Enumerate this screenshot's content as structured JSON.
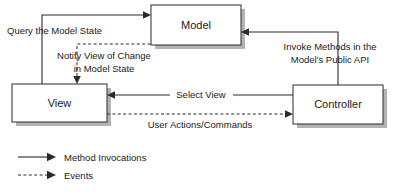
{
  "diagram": {
    "background_color": "#ffffff",
    "line_color": "#2b2b2b",
    "shadow_color": "#b3b3b3",
    "nodes": [
      {
        "id": "model",
        "label": "Model",
        "x": 151,
        "y": 5,
        "w": 90,
        "h": 40
      },
      {
        "id": "view",
        "label": "View",
        "x": 12,
        "y": 84,
        "w": 95,
        "h": 38
      },
      {
        "id": "controller",
        "label": "Controller",
        "x": 293,
        "y": 85,
        "w": 90,
        "h": 39
      }
    ],
    "edges": [
      {
        "id": "query-model-state",
        "label": "Query the Model State",
        "from": "view",
        "to": "model",
        "style": "solid",
        "label_x": 7,
        "label_y": 34
      },
      {
        "id": "notify-view-of-change",
        "label_line1": "Notify View of Change",
        "label_line2": "in  Model State",
        "from": "model",
        "to": "view",
        "style": "dashed",
        "label_x": 104,
        "label_y": 60
      },
      {
        "id": "invoke-methods",
        "label_line1": "Invoke Methods in the",
        "label_line2": "Model's Public API",
        "from": "controller",
        "to": "model",
        "style": "solid",
        "label_x": 330,
        "label_y": 50
      },
      {
        "id": "select-view",
        "label": "Select View",
        "from": "controller",
        "to": "view",
        "style": "solid",
        "label_x": 200,
        "label_y": 98
      },
      {
        "id": "user-actions-commands",
        "label": "User Actions/Commands",
        "from": "view",
        "to": "controller",
        "style": "dashed",
        "label_x": 200,
        "label_y": 128
      }
    ],
    "legend": {
      "items": [
        {
          "id": "method-invocations",
          "label": "Method Invocations",
          "style": "solid",
          "y": 157
        },
        {
          "id": "events",
          "label": "Events",
          "style": "dashed",
          "y": 175
        }
      ]
    }
  }
}
